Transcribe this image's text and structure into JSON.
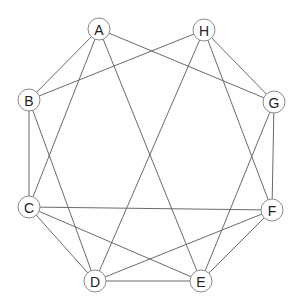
{
  "diagram": {
    "type": "undirected-graph",
    "node_radius": 11,
    "colors": {
      "edge": "#6a6a6a",
      "node_stroke": "#8a8a8a",
      "node_fill": "#ffffff",
      "label": "#222222"
    },
    "nodes": [
      {
        "id": "A",
        "label": "A",
        "x": 99,
        "y": 29
      },
      {
        "id": "H",
        "label": "H",
        "x": 204,
        "y": 30
      },
      {
        "id": "B",
        "label": "B",
        "x": 29,
        "y": 100
      },
      {
        "id": "G",
        "label": "G",
        "x": 274,
        "y": 102
      },
      {
        "id": "C",
        "label": "C",
        "x": 29,
        "y": 207
      },
      {
        "id": "F",
        "label": "F",
        "x": 272,
        "y": 210
      },
      {
        "id": "D",
        "label": "D",
        "x": 95,
        "y": 281
      },
      {
        "id": "E",
        "label": "E",
        "x": 201,
        "y": 281
      }
    ],
    "edges": [
      [
        "A",
        "B"
      ],
      [
        "A",
        "C"
      ],
      [
        "A",
        "E"
      ],
      [
        "A",
        "G"
      ],
      [
        "H",
        "B"
      ],
      [
        "H",
        "D"
      ],
      [
        "H",
        "F"
      ],
      [
        "H",
        "G"
      ],
      [
        "B",
        "C"
      ],
      [
        "B",
        "D"
      ],
      [
        "G",
        "F"
      ],
      [
        "G",
        "E"
      ],
      [
        "C",
        "F"
      ],
      [
        "C",
        "D"
      ],
      [
        "C",
        "E"
      ],
      [
        "D",
        "F"
      ],
      [
        "D",
        "E"
      ],
      [
        "E",
        "F"
      ]
    ]
  }
}
